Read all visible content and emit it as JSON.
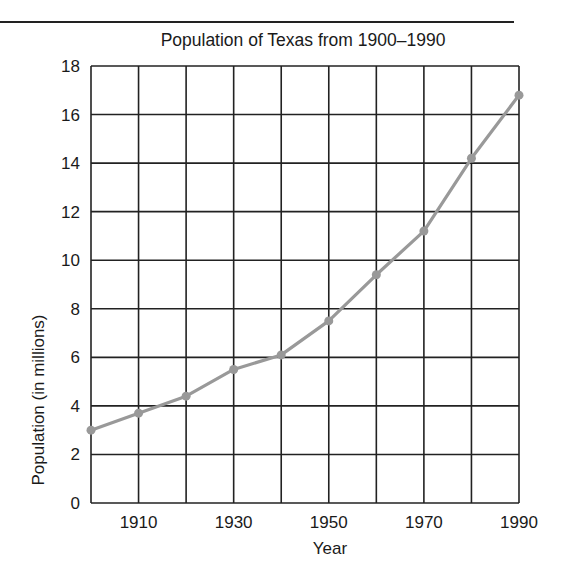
{
  "chart_data": {
    "type": "line",
    "title": "Population of Texas from 1900–1990",
    "xlabel": "Year",
    "ylabel": "Population (in millions)",
    "x": [
      1900,
      1910,
      1920,
      1930,
      1940,
      1950,
      1960,
      1970,
      1980,
      1990
    ],
    "series": [
      {
        "name": "Population of Texas",
        "values": [
          3.0,
          3.7,
          4.4,
          5.5,
          6.1,
          7.5,
          9.4,
          11.2,
          14.2,
          16.8
        ]
      }
    ],
    "xlim": [
      1900,
      1990
    ],
    "ylim": [
      0,
      18
    ],
    "x_tick_labels": [
      "1910",
      "1930",
      "1950",
      "1970",
      "1990"
    ],
    "y_tick_labels": [
      "0",
      "2",
      "4",
      "6",
      "8",
      "10",
      "12",
      "14",
      "16",
      "18"
    ],
    "grid": true,
    "legend": null,
    "colors": {
      "line": "#999999",
      "grid": "#222222"
    }
  }
}
